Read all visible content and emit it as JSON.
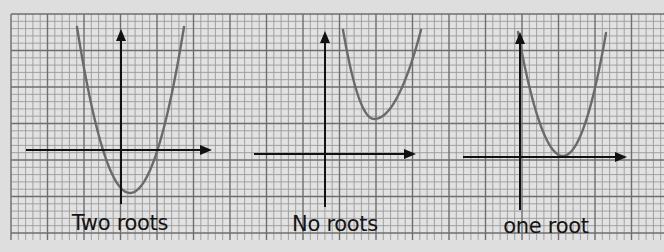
{
  "colors": {
    "background": "#dedede",
    "paper": "#e2e2e2",
    "grid_minor": "#9a9a9a",
    "grid_major": "#6e6e6e",
    "axis": "#111111",
    "curve": "#6a6a6a",
    "label": "#141414"
  },
  "grid": {
    "left": 11,
    "top": 14,
    "right": 664,
    "bottom": 240,
    "minor_step": 7.3,
    "major_every": 5
  },
  "panels": [
    {
      "id": "two-roots",
      "label": "Two roots",
      "label_pos": {
        "x": 120,
        "y": 211
      },
      "axes": {
        "x_axis": {
          "y": 150,
          "x1": 26,
          "x2": 212
        },
        "y_axis": {
          "x": 121,
          "y1": 29,
          "y2": 204
        }
      },
      "curve": {
        "left": [
          77,
          27
        ],
        "vertex": [
          130,
          193
        ],
        "right": [
          184,
          27
        ]
      },
      "roots": 2
    },
    {
      "id": "no-roots",
      "label": "No roots",
      "label_pos": {
        "x": 335,
        "y": 212
      },
      "axes": {
        "x_axis": {
          "y": 154,
          "x1": 254,
          "x2": 416
        },
        "y_axis": {
          "x": 325,
          "y1": 31,
          "y2": 207
        }
      },
      "curve": {
        "left": [
          343,
          30
        ],
        "vertex": [
          374,
          119
        ],
        "right": [
          421,
          30
        ]
      },
      "roots": 0
    },
    {
      "id": "one-root",
      "label": "one root",
      "label_pos": {
        "x": 546,
        "y": 214
      },
      "axes": {
        "x_axis": {
          "y": 157,
          "x1": 463,
          "x2": 627
        },
        "y_axis": {
          "x": 520,
          "y1": 32,
          "y2": 210
        }
      },
      "curve": {
        "left": [
          518,
          32
        ],
        "vertex": [
          563,
          156
        ],
        "right": [
          606,
          33
        ]
      },
      "roots": 1
    }
  ]
}
